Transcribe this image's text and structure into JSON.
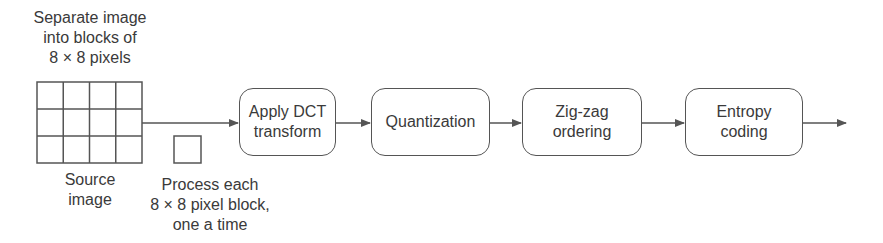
{
  "diagram": {
    "source_caption": "Separate image\ninto blocks of\n8 × 8 pixels",
    "source_label": "Source\nimage",
    "block_label": "Process each\n8 × 8 pixel block,\none a time",
    "grid": {
      "columns": 4,
      "rows": 3
    },
    "steps": [
      {
        "id": "dct",
        "label": "Apply DCT\ntransform"
      },
      {
        "id": "quantization",
        "label": "Quantization"
      },
      {
        "id": "zigzag",
        "label": "Zig-zag\nordering"
      },
      {
        "id": "entropy",
        "label": "Entropy\ncoding"
      }
    ],
    "colors": {
      "stroke": "#555555",
      "text": "#3a3a3a",
      "background": "#ffffff"
    }
  }
}
